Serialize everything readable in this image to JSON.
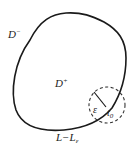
{
  "diagram": {
    "labels": {
      "outer_region": "D",
      "outer_sup": "−",
      "inner_region": "D",
      "inner_sup": "+",
      "radius": "ε",
      "point_base": "t",
      "point_sub": "0",
      "contour_main": "L−L",
      "contour_sub": "ε"
    },
    "colors": {
      "stroke": "#1a1a1a",
      "text": "#222222",
      "background": "#ffffff"
    }
  }
}
